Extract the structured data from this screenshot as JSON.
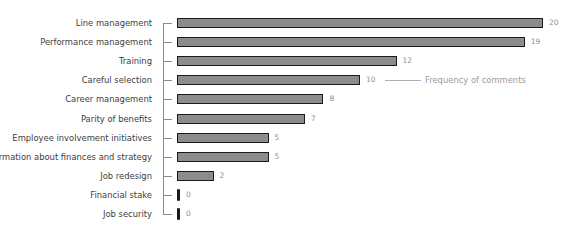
{
  "chart_data": {
    "type": "bar",
    "orientation": "horizontal",
    "title": "",
    "xlabel": "",
    "ylabel": "",
    "categories": [
      "Line management",
      "Performance management",
      "Training",
      "Careful selection",
      "Career management",
      "Parity of benefits",
      "Employee involvement initiatives",
      "Information about finances and strategy",
      "Job redesign",
      "Financial stake",
      "Job security"
    ],
    "values": [
      20,
      19,
      12,
      10,
      8,
      7,
      5,
      5,
      2,
      0,
      0
    ],
    "series": [
      {
        "name": "Frequency of comments",
        "values": [
          20,
          19,
          12,
          10,
          8,
          7,
          5,
          5,
          2,
          0,
          0
        ]
      }
    ],
    "legend": {
      "entries": [
        "Frequency of comments"
      ],
      "position": "inline, right of 'Careful selection' bar"
    },
    "xlim": [
      0,
      20
    ],
    "grid": false,
    "data_labels": true,
    "colors": {
      "bar_fill": "#8c8c8c",
      "bar_border": "#1a1a1a",
      "label": "#3c3c3c",
      "value": "#8f8f8f"
    }
  }
}
